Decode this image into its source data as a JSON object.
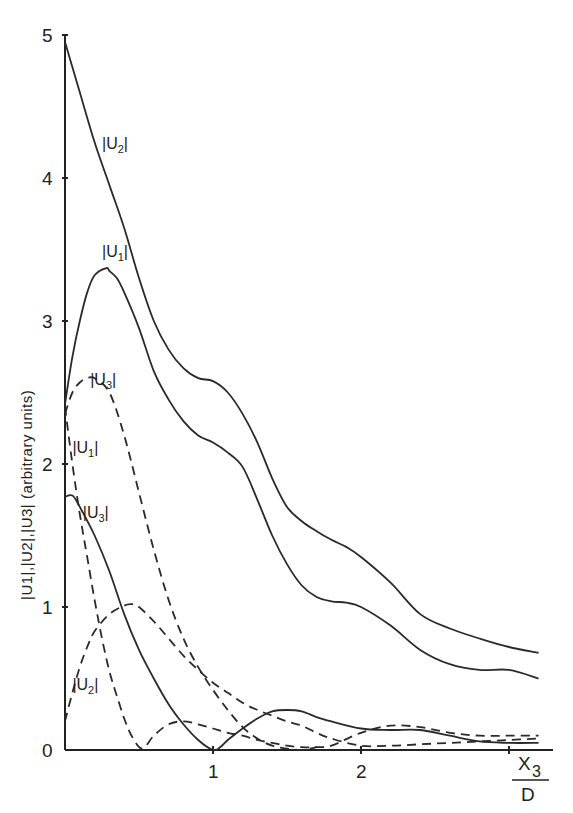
{
  "chart_data": {
    "type": "line",
    "title": "",
    "xlabel": "X3/D",
    "xlabel_numerator": "X",
    "xlabel_subscript": "3",
    "xlabel_denominator": "D",
    "ylabel": "|U1|,|U2|,|U3| (arbitrary units)",
    "xlim": [
      0,
      3.3
    ],
    "ylim": [
      0,
      5
    ],
    "x_ticks": [
      {
        "value": 1,
        "label": "1"
      },
      {
        "value": 2,
        "label": "2"
      },
      {
        "value": 3,
        "label": ""
      }
    ],
    "y_ticks": [
      {
        "value": 0,
        "label": "0"
      },
      {
        "value": 1,
        "label": "1"
      },
      {
        "value": 2,
        "label": "2"
      },
      {
        "value": 3,
        "label": "3"
      },
      {
        "value": 4,
        "label": "4"
      },
      {
        "value": 5,
        "label": "5"
      }
    ],
    "grid": false,
    "legend": "none (curves labelled inline)",
    "series": [
      {
        "name": "|U2| (upper, solid)",
        "label_main": "|U",
        "label_sub": "2",
        "style": "solid",
        "label_pos": [
          0.25,
          4.2
        ],
        "x": [
          0,
          0.1,
          0.2,
          0.3,
          0.4,
          0.5,
          0.6,
          0.7,
          0.8,
          0.9,
          1.0,
          1.1,
          1.2,
          1.3,
          1.4,
          1.5,
          1.6,
          1.7,
          1.8,
          1.9,
          2.0,
          2.2,
          2.4,
          2.6,
          2.8,
          3.0,
          3.2
        ],
        "y": [
          4.95,
          4.6,
          4.25,
          3.95,
          3.65,
          3.3,
          3.0,
          2.8,
          2.67,
          2.6,
          2.58,
          2.5,
          2.35,
          2.15,
          1.9,
          1.7,
          1.6,
          1.53,
          1.47,
          1.42,
          1.35,
          1.17,
          0.95,
          0.85,
          0.78,
          0.72,
          0.68
        ]
      },
      {
        "name": "|U1| (upper, solid)",
        "label_main": "|U",
        "label_sub": "1",
        "style": "solid",
        "label_pos": [
          0.25,
          3.45
        ],
        "x": [
          0,
          0.05,
          0.1,
          0.15,
          0.2,
          0.28,
          0.3,
          0.35,
          0.4,
          0.5,
          0.6,
          0.7,
          0.8,
          0.9,
          1.0,
          1.1,
          1.2,
          1.3,
          1.4,
          1.5,
          1.6,
          1.7,
          1.8,
          1.9,
          2.0,
          2.2,
          2.4,
          2.6,
          2.8,
          3.0,
          3.2
        ],
        "y": [
          2.42,
          2.75,
          3.0,
          3.2,
          3.32,
          3.37,
          3.35,
          3.3,
          3.2,
          2.95,
          2.65,
          2.45,
          2.3,
          2.2,
          2.15,
          2.08,
          1.98,
          1.75,
          1.5,
          1.3,
          1.15,
          1.07,
          1.04,
          1.03,
          1.0,
          0.87,
          0.7,
          0.6,
          0.56,
          0.56,
          0.5
        ]
      },
      {
        "name": "|U3| (upper, dashed)",
        "label_main": "|U",
        "label_sub": "3",
        "style": "dashed",
        "label_pos": [
          0.17,
          2.55
        ],
        "x": [
          0,
          0.05,
          0.1,
          0.15,
          0.2,
          0.3,
          0.4,
          0.5,
          0.6,
          0.7,
          0.8,
          0.9,
          1.0,
          1.1,
          1.2,
          1.3,
          1.4,
          1.5,
          1.6,
          1.7
        ],
        "y": [
          2.35,
          2.5,
          2.57,
          2.6,
          2.6,
          2.5,
          2.2,
          1.8,
          1.4,
          1.05,
          0.78,
          0.58,
          0.42,
          0.28,
          0.16,
          0.08,
          0.03,
          0.01,
          0.0,
          0.02
        ]
      },
      {
        "name": "|U1| (lower, dashed)",
        "label_main": "|U",
        "label_sub": "1",
        "style": "dashed",
        "label_pos": [
          0.05,
          2.08
        ],
        "x": [
          0,
          0.05,
          0.1,
          0.15,
          0.2,
          0.25,
          0.3,
          0.35,
          0.4,
          0.45,
          0.52,
          0.6,
          0.7,
          0.8,
          0.9,
          1.0,
          1.1,
          1.2,
          1.3,
          1.4,
          1.5,
          1.6,
          1.7,
          1.8,
          2.0,
          2.2,
          2.4,
          2.6,
          2.8,
          3.0,
          3.2
        ],
        "y": [
          2.4,
          2.0,
          1.65,
          1.35,
          1.05,
          0.78,
          0.55,
          0.38,
          0.22,
          0.1,
          0.01,
          0.1,
          0.18,
          0.2,
          0.18,
          0.15,
          0.12,
          0.1,
          0.07,
          0.05,
          0.03,
          0.02,
          0.02,
          0.03,
          0.12,
          0.17,
          0.16,
          0.12,
          0.1,
          0.1,
          0.1
        ]
      },
      {
        "name": "|U3| (lower, solid)",
        "label_main": "|U",
        "label_sub": "3",
        "style": "solid",
        "label_pos": [
          0.12,
          1.62
        ],
        "x": [
          0,
          0.05,
          0.1,
          0.2,
          0.3,
          0.4,
          0.5,
          0.6,
          0.7,
          0.8,
          0.9,
          1.0,
          1.05,
          1.1,
          1.2,
          1.3,
          1.4,
          1.5,
          1.6,
          1.7,
          1.8,
          2.0,
          2.2,
          2.4,
          2.6,
          2.8,
          3.0,
          3.2
        ],
        "y": [
          1.77,
          1.78,
          1.7,
          1.5,
          1.25,
          0.95,
          0.7,
          0.5,
          0.32,
          0.18,
          0.07,
          0.0,
          0.02,
          0.07,
          0.15,
          0.22,
          0.27,
          0.28,
          0.27,
          0.23,
          0.2,
          0.15,
          0.14,
          0.14,
          0.1,
          0.06,
          0.05,
          0.05
        ]
      },
      {
        "name": "|U2| (lower, dashed)",
        "label_main": "|U",
        "label_sub": "2",
        "style": "dashed",
        "label_pos": [
          0.05,
          0.42
        ],
        "x": [
          0,
          0.05,
          0.1,
          0.15,
          0.2,
          0.3,
          0.4,
          0.45,
          0.5,
          0.6,
          0.7,
          0.8,
          0.9,
          1.0,
          1.1,
          1.2,
          1.3,
          1.4,
          1.5,
          1.6,
          1.7,
          1.8,
          2.0,
          2.2,
          2.4,
          2.6,
          2.8,
          3.0,
          3.2
        ],
        "y": [
          0.2,
          0.4,
          0.58,
          0.72,
          0.83,
          0.95,
          1.01,
          1.02,
          1.0,
          0.9,
          0.78,
          0.66,
          0.56,
          0.47,
          0.4,
          0.33,
          0.28,
          0.24,
          0.2,
          0.17,
          0.12,
          0.08,
          0.03,
          0.03,
          0.04,
          0.05,
          0.06,
          0.07,
          0.08
        ]
      }
    ]
  }
}
